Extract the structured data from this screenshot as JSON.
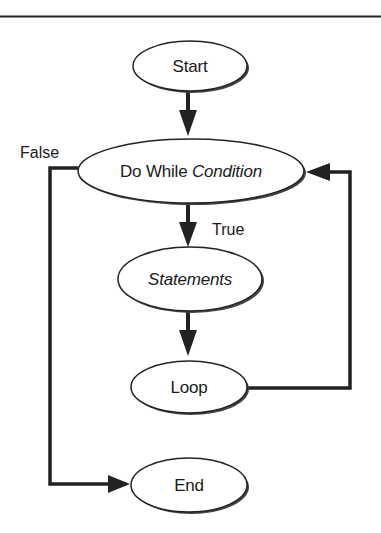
{
  "diagram": {
    "type": "flowchart",
    "title": "",
    "colors": {
      "stroke": "#222222",
      "fill": "#ffffff",
      "shadow": "#444444",
      "rule": "#222222"
    },
    "nodes": [
      {
        "id": "start",
        "shape": "ellipse",
        "label": "Start",
        "italic": false
      },
      {
        "id": "do_while",
        "shape": "ellipse",
        "label_prefix": "Do While ",
        "label_italic": "Condition"
      },
      {
        "id": "statements",
        "shape": "ellipse",
        "label": "Statements",
        "italic": true
      },
      {
        "id": "loop",
        "shape": "ellipse",
        "label": "Loop",
        "italic": false
      },
      {
        "id": "end",
        "shape": "ellipse",
        "label": "End",
        "italic": false
      }
    ],
    "edges": [
      {
        "from": "start",
        "to": "do_while",
        "label": ""
      },
      {
        "from": "do_while",
        "to": "statements",
        "label": "True"
      },
      {
        "from": "statements",
        "to": "loop",
        "label": ""
      },
      {
        "from": "loop",
        "to": "do_while",
        "label": ""
      },
      {
        "from": "do_while",
        "to": "end",
        "label": "False"
      }
    ]
  }
}
